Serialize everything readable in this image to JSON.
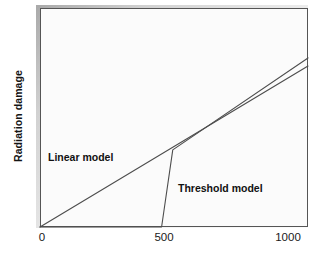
{
  "chart_data": {
    "type": "line",
    "title": "",
    "subtitle": "",
    "xlabel": "",
    "ylabel": "Radiation damage",
    "xlim": [
      0,
      1080
    ],
    "ylim": [
      0,
      100
    ],
    "xticks": [
      0,
      500,
      1000
    ],
    "xticklabels": [
      "0",
      "500",
      "1000"
    ],
    "yticks": [],
    "yticklabels": [],
    "grid": false,
    "legend_position": "inline-annotations",
    "annotations": [
      {
        "text": "Linear model",
        "x": 130,
        "y": 40
      },
      {
        "text": "Threshold model",
        "x": 555,
        "y": 22
      }
    ],
    "series": [
      {
        "name": "Linear model",
        "label": "Linear model",
        "color": "#4d4d4d",
        "x": [
          0,
          1080
        ],
        "values": [
          0,
          73.5
        ],
        "description": "Straight proportional line through the origin; damage rises linearly with dose from zero."
      },
      {
        "name": "Threshold model",
        "label": "Threshold model",
        "color": "#4d4d4d",
        "x": [
          0,
          490,
          535,
          1080
        ],
        "values": [
          0,
          0,
          35.2,
          77.2
        ],
        "description": "No damage below a threshold dose near 490, then a steep rise to about 535 followed by a slope parallel to the linear model."
      }
    ]
  },
  "axes": {
    "x_tick_0": "0",
    "x_tick_500": "500",
    "x_tick_1000": "1000",
    "y_axis_title": "Radiation damage"
  },
  "labels": {
    "linear": "Linear model",
    "threshold": "Threshold model"
  },
  "colors": {
    "line": "#4d4d4d",
    "frame": "#555555",
    "panel_background": "#fbfbfb",
    "page_background": "#ffffff",
    "text": "#141414",
    "shadow": "#9a9a9a"
  }
}
